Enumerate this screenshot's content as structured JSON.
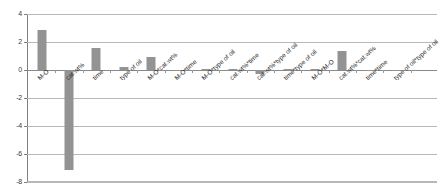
{
  "chart_data": {
    "type": "bar",
    "title": "",
    "subtitle": "",
    "xlabel": "",
    "ylabel": "",
    "ylim": [
      -8,
      4
    ],
    "yticks": [
      4,
      2,
      0,
      -2,
      -4,
      -6,
      -8
    ],
    "ytick_labels": [
      "4",
      "2",
      "0",
      "-2",
      "-4",
      "-6",
      "-8"
    ],
    "grid": true,
    "legend": false,
    "legend_position": "none",
    "bar_color": "#939393",
    "categories": [
      "M-O",
      "cat.wt%",
      "time",
      "type of oil",
      "M-O*cat.wt%",
      "M-O*time",
      "M-O*type of oil",
      "cat.wt%*time",
      "cat.wt%*type of oil",
      "time*type of oil",
      "M-O*M-O",
      "cat.wt%*cat.wt%",
      "time*time",
      "type of oil*type of oil"
    ],
    "values": [
      2.85,
      -7.15,
      1.57,
      0.18,
      0.9,
      -0.1,
      0.05,
      0.0,
      -0.25,
      0.0,
      0.08,
      1.35,
      -0.06,
      -0.05
    ]
  },
  "axis": {
    "y_tick_0": "4",
    "y_tick_1": "2",
    "y_tick_2": "0",
    "y_tick_3": "-2",
    "y_tick_4": "-4",
    "y_tick_5": "-6",
    "y_tick_6": "-8"
  }
}
